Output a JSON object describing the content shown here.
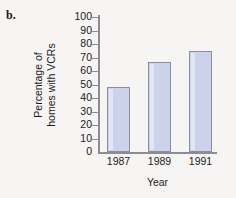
{
  "figure": {
    "part_label": "b."
  },
  "chart_data": {
    "type": "bar",
    "title": "",
    "xlabel": "Year",
    "ylabel_line1": "Percentage of",
    "ylabel_line2": "homes with VCRs",
    "ylabel": "Percentage of homes with VCRs",
    "categories": [
      "1987",
      "1989",
      "1991"
    ],
    "values": [
      48,
      67,
      75
    ],
    "ylim": [
      0,
      100
    ],
    "ytick_labels": [
      "100",
      "90",
      "80",
      "70",
      "60",
      "50",
      "40",
      "30",
      "20",
      "10",
      "0"
    ],
    "ytick_values": [
      100,
      90,
      80,
      70,
      60,
      50,
      40,
      30,
      20,
      10,
      0
    ],
    "grid": false,
    "legend": "none",
    "bar_fill_color": "#ccd2ea",
    "bar_border_color": "#8a8ea4",
    "axis_color": "#8c8c92",
    "background_color": "#f6f5f3"
  }
}
